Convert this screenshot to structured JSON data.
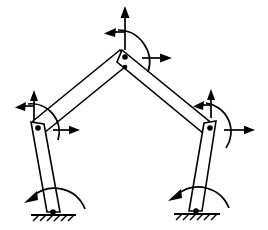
{
  "figure": {
    "type": "mechanism-diagram",
    "background_color": "#ffffff",
    "stroke_color": "#000000",
    "width": 268,
    "height": 230
  },
  "joints": [
    {
      "id": "apex",
      "name": "apex-joint",
      "label": "",
      "x": 125,
      "y": 57,
      "radius": 2.6
    },
    {
      "id": "left-knee",
      "name": "left-knee-joint",
      "label": "",
      "x": 39,
      "y": 128,
      "radius": 2.6
    },
    {
      "id": "right-knee",
      "name": "right-knee-joint",
      "label": "",
      "x": 209,
      "y": 128,
      "radius": 2.6
    },
    {
      "id": "left-base",
      "name": "left-base-pivot",
      "label": "",
      "x": 53,
      "y": 212,
      "radius": 2.6
    },
    {
      "id": "right-base",
      "name": "right-base-pivot",
      "label": "",
      "x": 196,
      "y": 211,
      "radius": 2.6
    }
  ],
  "links": [
    {
      "id": "upper-left",
      "name": "upper-left-link",
      "from": "left-knee",
      "to": "apex"
    },
    {
      "id": "upper-right",
      "name": "upper-right-link",
      "from": "apex",
      "to": "right-knee"
    },
    {
      "id": "lower-left",
      "name": "lower-left-link",
      "from": "left-knee",
      "to": "left-base"
    },
    {
      "id": "lower-right",
      "name": "lower-right-link",
      "from": "right-knee",
      "to": "right-base"
    }
  ],
  "force_arrows": [
    {
      "id": "apex-up",
      "name": "apex-force-up-arrow",
      "direction": "up",
      "at_joint": "apex"
    },
    {
      "id": "apex-left",
      "name": "apex-force-left-arrow",
      "direction": "left",
      "at_joint": "apex"
    },
    {
      "id": "apex-right",
      "name": "apex-force-right-arrow",
      "direction": "right",
      "at_joint": "apex"
    },
    {
      "id": "lknee-up",
      "name": "left-knee-force-up-arrow",
      "direction": "up",
      "at_joint": "left-knee"
    },
    {
      "id": "lknee-left",
      "name": "left-knee-force-left-arrow",
      "direction": "left",
      "at_joint": "left-knee"
    },
    {
      "id": "lknee-right",
      "name": "left-knee-force-right-arrow",
      "direction": "right",
      "at_joint": "left-knee"
    },
    {
      "id": "rknee-up",
      "name": "right-knee-force-up-arrow",
      "direction": "up",
      "at_joint": "right-knee"
    },
    {
      "id": "rknee-left",
      "name": "right-knee-force-left-arrow",
      "direction": "left",
      "at_joint": "right-knee"
    },
    {
      "id": "rknee-right",
      "name": "right-knee-force-right-arrow",
      "direction": "right",
      "at_joint": "right-knee"
    }
  ],
  "moment_arcs": [
    {
      "id": "apex-moment",
      "name": "apex-moment-arc",
      "at_joint": "apex",
      "sense": "clockwise"
    },
    {
      "id": "left-knee-moment",
      "name": "left-knee-moment-arc",
      "at_joint": "left-knee",
      "sense": "counterclockwise"
    },
    {
      "id": "right-knee-moment",
      "name": "right-knee-moment-arc",
      "at_joint": "right-knee",
      "sense": "counterclockwise"
    },
    {
      "id": "left-base-moment",
      "name": "left-base-moment-arc",
      "at_joint": "left-base",
      "sense": "counterclockwise"
    },
    {
      "id": "right-base-moment",
      "name": "right-base-moment-arc",
      "at_joint": "right-base",
      "sense": "counterclockwise"
    }
  ],
  "supports": [
    {
      "id": "left-support",
      "name": "left-ground-support",
      "x": 53,
      "y": 214,
      "half_width": 22,
      "hatch_count": 7
    },
    {
      "id": "right-support",
      "name": "right-ground-support",
      "x": 196,
      "y": 213,
      "half_width": 22,
      "hatch_count": 7
    }
  ]
}
